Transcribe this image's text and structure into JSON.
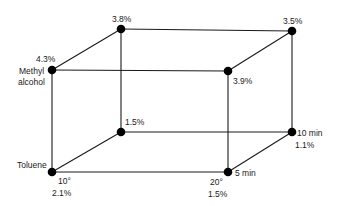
{
  "diagram": {
    "type": "cube-factorial-design",
    "colors": {
      "line": "#1a1a1a",
      "node": "#000000",
      "background": "#ffffff"
    },
    "factor_labels": {
      "solvent_low": "Toluene",
      "solvent_high_line1": "Methyl",
      "solvent_high_line2": "alcohol",
      "temp_low": "10°",
      "temp_high": "20°",
      "time_low": "5 min",
      "time_high": "10 min"
    },
    "nodes": [
      {
        "id": "front-bottom-left",
        "x": 52,
        "y": 172,
        "value": "2.1%"
      },
      {
        "id": "front-bottom-right",
        "x": 228,
        "y": 172,
        "value": "1.5%"
      },
      {
        "id": "front-top-left",
        "x": 52,
        "y": 70,
        "value": "4.3%"
      },
      {
        "id": "front-top-right",
        "x": 228,
        "y": 71,
        "value": "3.9%"
      },
      {
        "id": "back-bottom-left",
        "x": 121,
        "y": 132,
        "value": "1.5%"
      },
      {
        "id": "back-bottom-right",
        "x": 292,
        "y": 132,
        "value": "1.1%"
      },
      {
        "id": "back-top-left",
        "x": 121,
        "y": 29,
        "value": "3.8%"
      },
      {
        "id": "back-top-right",
        "x": 292,
        "y": 31,
        "value": "3.5%"
      }
    ]
  }
}
